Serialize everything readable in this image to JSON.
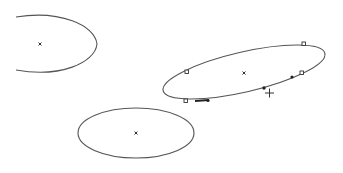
{
  "canvas": {
    "width": 343,
    "height": 173,
    "background": "#ffffff",
    "stroke_color": "#555555"
  },
  "shapes": [
    {
      "id": "ellipse-left",
      "type": "ellipse-partial",
      "center": [
        40,
        44
      ],
      "selected": false
    },
    {
      "id": "ellipse-selected",
      "type": "ellipse",
      "center": [
        244,
        73
      ],
      "rotation": -14,
      "selected": true,
      "square_handles": [
        [
          187,
          72
        ],
        [
          304,
          44
        ],
        [
          302,
          73
        ],
        [
          186,
          101
        ]
      ],
      "filled_knots": [
        [
          208,
          101
        ],
        [
          264,
          88
        ],
        [
          292,
          77
        ]
      ]
    },
    {
      "id": "ellipse-bottom",
      "type": "ellipse",
      "center": [
        136,
        133
      ],
      "selected": false
    }
  ],
  "cursor": {
    "type": "crosshair",
    "position": [
      269,
      93
    ]
  }
}
